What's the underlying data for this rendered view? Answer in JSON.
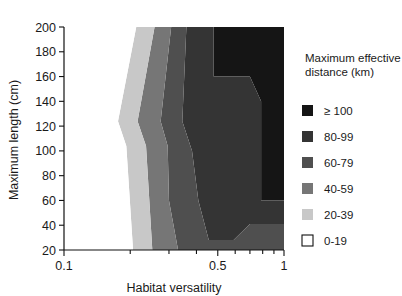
{
  "chart_data": {
    "type": "heatmap",
    "title": "",
    "xlabel": "Habitat versatility",
    "ylabel": "Maximum length (cm)",
    "xscale": "log",
    "xlim": [
      0.1,
      1
    ],
    "ylim": [
      20,
      200
    ],
    "xticks": [
      0.1,
      0.5,
      1
    ],
    "xtick_labels": [
      "0.1",
      "0.5",
      "1"
    ],
    "yticks": [
      20,
      40,
      60,
      80,
      100,
      120,
      140,
      160,
      180,
      200
    ],
    "ytick_labels": [
      "20",
      "40",
      "60",
      "80",
      "100",
      "120",
      "140",
      "160",
      "180",
      "200"
    ],
    "grid": false,
    "legend_position": "right",
    "legend_title": "Maximum effective distance (km)",
    "bands": [
      {
        "label": "≥ 100",
        "range": [
          100,
          null
        ],
        "color": "#151515",
        "polygon": [
          [
            0.479,
            200
          ],
          [
            1.0,
            200
          ],
          [
            1.0,
            60
          ],
          [
            0.787,
            60
          ],
          [
            0.787,
            140
          ],
          [
            0.7,
            160
          ],
          [
            0.479,
            160
          ]
        ]
      },
      {
        "label": "80-99",
        "range": [
          80,
          99
        ],
        "color": "#343434",
        "polygon": [
          [
            0.36,
            200
          ],
          [
            0.479,
            200
          ],
          [
            0.479,
            160
          ],
          [
            0.7,
            160
          ],
          [
            0.787,
            140
          ],
          [
            0.787,
            60
          ],
          [
            1.0,
            60
          ],
          [
            1.0,
            41
          ],
          [
            0.7,
            41
          ],
          [
            0.59,
            28
          ],
          [
            0.455,
            28
          ],
          [
            0.408,
            60
          ],
          [
            0.382,
            100
          ],
          [
            0.345,
            124
          ],
          [
            0.36,
            200
          ]
        ]
      },
      {
        "label": "60-79",
        "range": [
          60,
          79
        ],
        "color": "#4f4f4f",
        "polygon": [
          [
            0.307,
            200
          ],
          [
            0.36,
            200
          ],
          [
            0.345,
            124
          ],
          [
            0.382,
            100
          ],
          [
            0.408,
            60
          ],
          [
            0.455,
            28
          ],
          [
            0.59,
            28
          ],
          [
            0.7,
            41
          ],
          [
            1.0,
            41
          ],
          [
            1.0,
            20
          ],
          [
            0.33,
            20
          ],
          [
            0.3,
            60
          ],
          [
            0.296,
            104
          ],
          [
            0.275,
            124
          ],
          [
            0.307,
            200
          ]
        ]
      },
      {
        "label": "40-59",
        "range": [
          40,
          59
        ],
        "color": "#767676",
        "polygon": [
          [
            0.258,
            200
          ],
          [
            0.307,
            200
          ],
          [
            0.275,
            124
          ],
          [
            0.296,
            104
          ],
          [
            0.3,
            60
          ],
          [
            0.33,
            20
          ],
          [
            0.252,
            20
          ],
          [
            0.236,
            104
          ],
          [
            0.216,
            124
          ],
          [
            0.258,
            200
          ]
        ]
      },
      {
        "label": "20-39",
        "range": [
          20,
          39
        ],
        "color": "#c8c8c8",
        "polygon": [
          [
            0.213,
            200
          ],
          [
            0.258,
            200
          ],
          [
            0.216,
            124
          ],
          [
            0.236,
            104
          ],
          [
            0.252,
            20
          ],
          [
            0.206,
            20
          ],
          [
            0.192,
            104
          ],
          [
            0.176,
            124
          ],
          [
            0.213,
            200
          ]
        ]
      },
      {
        "label": "0-19",
        "range": [
          0,
          19
        ],
        "color": "#ffffff",
        "polygon": [
          [
            0.1,
            200
          ],
          [
            0.213,
            200
          ],
          [
            0.176,
            124
          ],
          [
            0.192,
            104
          ],
          [
            0.206,
            20
          ],
          [
            0.1,
            20
          ]
        ]
      }
    ],
    "legend_entries": [
      {
        "label": "≥ 100",
        "color": "#151515",
        "bordered": false
      },
      {
        "label": "80-99",
        "color": "#343434",
        "bordered": false
      },
      {
        "label": "60-79",
        "color": "#4f4f4f",
        "bordered": false
      },
      {
        "label": "40-59",
        "color": "#767676",
        "bordered": false
      },
      {
        "label": "20-39",
        "color": "#c8c8c8",
        "bordered": false
      },
      {
        "label": "0-19",
        "color": "#ffffff",
        "bordered": true
      }
    ],
    "minor_xticks": [
      0.2,
      0.3,
      0.4,
      0.6,
      0.7,
      0.8,
      0.9
    ]
  }
}
